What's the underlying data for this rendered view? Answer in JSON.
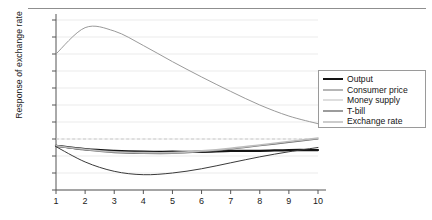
{
  "figure": {
    "top_rule": "rule",
    "plot_background": "#ffffff"
  },
  "chart_data": {
    "type": "line",
    "title": "",
    "subtitle": "",
    "xlabel": "",
    "ylabel": "Response of exchange rate",
    "x": [
      1,
      2,
      3,
      4,
      5,
      6,
      7,
      8,
      9,
      10
    ],
    "xlim": [
      1,
      10
    ],
    "ylim": [
      -0.06,
      0.14
    ],
    "yticks": [
      -0.06,
      -0.04,
      -0.02,
      0,
      0.02,
      0.04,
      0.06,
      0.08,
      0.1,
      0.12,
      0.14
    ],
    "ytick_labels": [
      "–0.06",
      "–0.04",
      "–0.02",
      "0",
      "0.02",
      "0.04",
      "0.06",
      "0.08",
      "0.10",
      "0.12",
      "0.14"
    ],
    "xtick_labels": [
      "1",
      "2",
      "3",
      "4",
      "5",
      "6",
      "7",
      "8",
      "9",
      "10"
    ],
    "grid": "horizontal",
    "zero_line": {
      "value": 0,
      "style": "dashed",
      "color": "#c9c9c9"
    },
    "legend_position": "right",
    "series": [
      {
        "name": "Output",
        "color": "#141414",
        "width": 2.3,
        "values": [
          -0.008,
          -0.012,
          -0.014,
          -0.015,
          -0.015,
          -0.015,
          -0.014,
          -0.014,
          -0.013,
          -0.013
        ]
      },
      {
        "name": "Consumer price",
        "color": "#6e6e6e",
        "width": 1.1,
        "values": [
          -0.008,
          -0.013,
          -0.016,
          -0.017,
          -0.017,
          -0.015,
          -0.012,
          -0.008,
          -0.004,
          0.0
        ]
      },
      {
        "name": "Money supply",
        "color": "#bdbdbd",
        "width": 1.6,
        "values": [
          -0.008,
          -0.012,
          -0.015,
          -0.016,
          -0.016,
          -0.014,
          -0.011,
          -0.007,
          -0.003,
          0.001
        ]
      },
      {
        "name": "T-bill",
        "color": "#3a3a3a",
        "width": 1.0,
        "values": [
          -0.009,
          -0.027,
          -0.038,
          -0.042,
          -0.04,
          -0.035,
          -0.028,
          -0.021,
          -0.015,
          -0.01
        ]
      },
      {
        "name": "Exchange rate",
        "color": "#9a9a9a",
        "width": 1.0,
        "values": [
          0.1,
          0.131,
          0.127,
          0.11,
          0.091,
          0.073,
          0.056,
          0.04,
          0.027,
          0.018
        ]
      }
    ]
  },
  "legend": {
    "items": [
      {
        "label": "Output"
      },
      {
        "label": "Consumer price"
      },
      {
        "label": "Money supply"
      },
      {
        "label": "T-bill"
      },
      {
        "label": "Exchange rate"
      }
    ]
  }
}
